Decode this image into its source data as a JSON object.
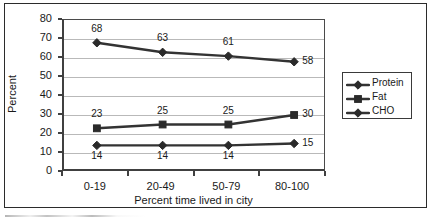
{
  "chart_data": {
    "type": "line",
    "title": "",
    "xlabel": "Percent time lived in city",
    "ylabel": "Percent",
    "categories": [
      "0-19",
      "20-49",
      "50-79",
      "80-100"
    ],
    "ylim": [
      0,
      80
    ],
    "ytick_step": 10,
    "yticks": [
      "0",
      "10",
      "20",
      "30",
      "40",
      "50",
      "60",
      "70",
      "80"
    ],
    "grid": "horizontal",
    "legend_position": "right",
    "series": [
      {
        "name": "Protein",
        "marker": "diamond",
        "values": [
          14,
          14,
          14,
          15
        ],
        "labels": [
          "14",
          "14",
          "14",
          "15"
        ],
        "label_position": "below"
      },
      {
        "name": "Fat",
        "marker": "square",
        "values": [
          23,
          25,
          25,
          30
        ],
        "labels": [
          "23",
          "25",
          "25",
          "30"
        ],
        "label_position": "above"
      },
      {
        "name": "CHO",
        "marker": "diamond",
        "values": [
          68,
          63,
          61,
          58
        ],
        "labels": [
          "68",
          "63",
          "61",
          "58"
        ],
        "label_position": "above"
      }
    ],
    "colors": {
      "line": "#333333",
      "marker": "#2a2a2a",
      "grid": "#b9b9b9",
      "axis": "#404040",
      "text": "#1a1a1a",
      "background": "#ffffff"
    }
  }
}
